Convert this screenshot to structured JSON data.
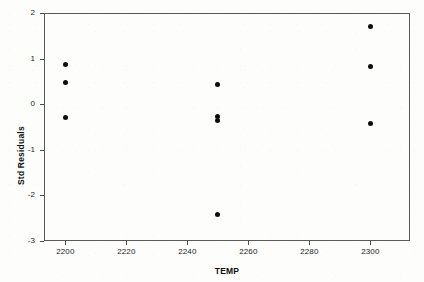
{
  "chart_data": {
    "type": "scatter",
    "title": "",
    "xlabel": "TEMP",
    "ylabel": "Std Residuals",
    "xlim": [
      2193,
      2313
    ],
    "ylim": [
      -3,
      2
    ],
    "xticks": [
      2200,
      2220,
      2240,
      2260,
      2280,
      2300
    ],
    "xtick_labels": [
      "2200",
      "2220",
      "2240",
      "2260",
      "2280",
      "2300"
    ],
    "yticks": [
      2,
      1,
      0,
      -1,
      -2,
      -3
    ],
    "ytick_labels": [
      "2",
      "1",
      "0",
      "-1",
      "-2",
      "-3"
    ],
    "grid": false,
    "legend": false,
    "marker": "filled-circle",
    "marker_color": "#0d0d0d",
    "series": [
      {
        "name": "Std Residuals vs TEMP",
        "points": [
          {
            "x": 2200,
            "y": 0.87
          },
          {
            "x": 2200,
            "y": 0.48
          },
          {
            "x": 2200,
            "y": -0.29
          },
          {
            "x": 2250,
            "y": 0.44
          },
          {
            "x": 2250,
            "y": -0.27
          },
          {
            "x": 2250,
            "y": -0.36
          },
          {
            "x": 2250,
            "y": -2.41
          },
          {
            "x": 2300,
            "y": 1.7
          },
          {
            "x": 2300,
            "y": 0.82
          },
          {
            "x": 2300,
            "y": -0.42
          }
        ]
      }
    ]
  },
  "axes": {
    "x_title": "TEMP",
    "y_title": "Std Residuals"
  }
}
